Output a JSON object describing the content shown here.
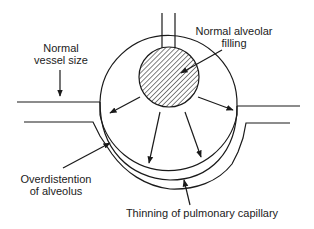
{
  "labels": {
    "normal_vessel_size": {
      "line1": "Normal",
      "line2": "vessel size"
    },
    "normal_alveolar_filling": {
      "line1": "Normal alveolar",
      "line2": "filling"
    },
    "overdistention": {
      "line1": "Overdistention",
      "line2": "of alveolus"
    },
    "thinning": {
      "line1": "Thinning of pulmonary capillary"
    }
  },
  "colors": {
    "stroke": "#1a1a1a",
    "text": "#222222",
    "background": "#ffffff"
  }
}
